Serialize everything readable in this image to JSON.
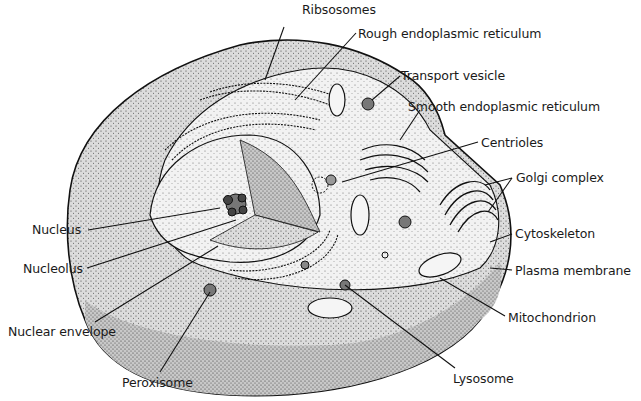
{
  "diagram": {
    "colors": {
      "ink": "#1a1a1a",
      "background": "#ffffff",
      "cytoplasm_light": "#ececec",
      "cytoplasm_dark": "#b9b9b9",
      "nucleus": "#d4d4d4"
    },
    "labels": [
      {
        "id": "ribosomes",
        "text": "Ribsosomes",
        "x": 302,
        "y": 3
      },
      {
        "id": "rough-er",
        "text": "Rough endoplasmic reticulum",
        "x": 358,
        "y": 27
      },
      {
        "id": "transport-vesicle",
        "text": "Transport vesicle",
        "x": 401,
        "y": 69
      },
      {
        "id": "smooth-er",
        "text": "Smooth endoplasmic reticulum",
        "x": 408,
        "y": 100
      },
      {
        "id": "centrioles",
        "text": "Centrioles",
        "x": 481,
        "y": 136
      },
      {
        "id": "golgi-complex",
        "text": "Golgi complex",
        "x": 516,
        "y": 171
      },
      {
        "id": "cytoskeleton",
        "text": "Cytoskeleton",
        "x": 515,
        "y": 227
      },
      {
        "id": "plasma-membrane",
        "text": "Plasma membrane",
        "x": 515,
        "y": 264
      },
      {
        "id": "mitochondrion",
        "text": "Mitochondrion",
        "x": 508,
        "y": 311
      },
      {
        "id": "lysosome",
        "text": "Lysosome",
        "x": 453,
        "y": 372
      },
      {
        "id": "peroxisome",
        "text": "Peroxisome",
        "x": 122,
        "y": 376
      },
      {
        "id": "nuclear-envelope",
        "text": "Nuclear envelope",
        "x": 8,
        "y": 325
      },
      {
        "id": "nucleolus",
        "text": "Nucleolus",
        "x": 23,
        "y": 262
      },
      {
        "id": "nucleus",
        "text": "Nucleus",
        "x": 32,
        "y": 223
      }
    ]
  }
}
